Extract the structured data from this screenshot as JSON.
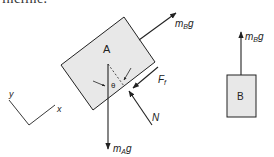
{
  "clipped_text": "incline.",
  "colors": {
    "stroke": "#222222",
    "block_fill": "#e8e8e8",
    "background": "#ffffff"
  },
  "block_a": {
    "label": "A",
    "points": "61,65 124,17 155,62 93,110"
  },
  "block_b": {
    "label": "B",
    "x": 227,
    "y": 75,
    "w": 29,
    "h": 42
  },
  "forces_a": {
    "tension": {
      "base": "m",
      "sub": "B",
      "tail": "g",
      "x1": 139,
      "y1": 40,
      "x2": 176,
      "y2": 13
    },
    "weight": {
      "base": "m",
      "sub": "A",
      "tail": "g",
      "x1": 108,
      "y1": 64,
      "x2": 108,
      "y2": 149
    },
    "friction": {
      "base": "F",
      "sub": "f",
      "x1": 158,
      "y1": 67,
      "x2": 133,
      "y2": 88
    },
    "normal": {
      "base": "N",
      "x1": 152,
      "y1": 125,
      "x2": 129,
      "y2": 91
    }
  },
  "forces_b": {
    "tension": {
      "base": "m",
      "sub": "B",
      "tail": "g",
      "x1": 241,
      "y1": 75,
      "x2": 241,
      "y2": 32
    }
  },
  "angle": {
    "label": "θ"
  },
  "axes": {
    "x_label": "x",
    "y_label": "y"
  }
}
